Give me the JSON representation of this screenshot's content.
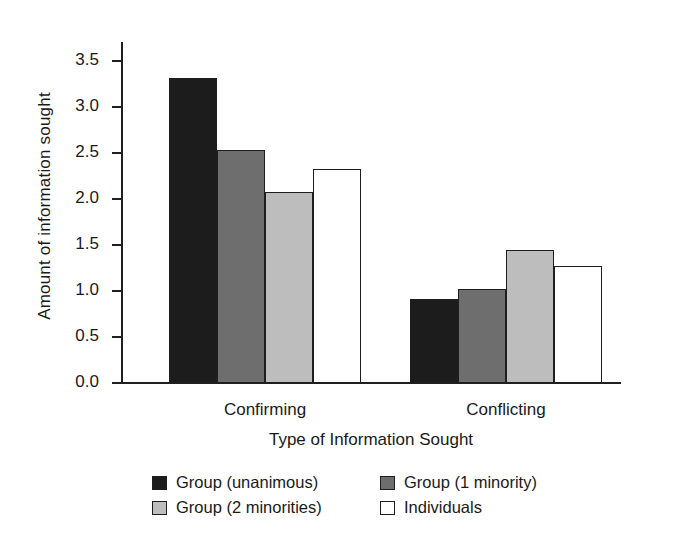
{
  "chart_data": {
    "type": "bar",
    "title": "",
    "xlabel": "Type of Information Sought",
    "ylabel": "Amount of information sought",
    "categories": [
      "Confirming",
      "Conflicting"
    ],
    "ylim": [
      0.0,
      3.7
    ],
    "yticks": [
      "0.0",
      "0.5",
      "1.0",
      "1.5",
      "2.0",
      "2.5",
      "3.0",
      "3.5"
    ],
    "ytick_values": [
      0.0,
      0.5,
      1.0,
      1.5,
      2.0,
      2.5,
      3.0,
      3.5
    ],
    "grid": false,
    "legend_position": "bottom",
    "series": [
      {
        "name": "Group (unanimous)",
        "color": "#1c1c1c",
        "values": [
          3.32,
          0.91
        ]
      },
      {
        "name": "Group (1 minority)",
        "color": "#6e6e6e",
        "values": [
          2.54,
          1.02
        ]
      },
      {
        "name": "Group (2 minorities)",
        "color": "#bdbdbd",
        "values": [
          2.08,
          1.45
        ]
      },
      {
        "name": "Individuals",
        "color": "#ffffff",
        "values": [
          2.33,
          1.27
        ]
      }
    ],
    "legend_order": [
      "Group (unanimous)",
      "Group (1 minority)",
      "Group (2 minorities)",
      "Individuals"
    ]
  }
}
